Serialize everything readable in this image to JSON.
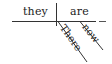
{
  "diagram": {
    "type": "sentence-diagram",
    "style": "Reed-Kellogg",
    "colors": {
      "line": "#333333",
      "text": "#222222",
      "background": "#ffffff"
    },
    "subject": "they",
    "verb": "are",
    "modifiers": [
      {
        "word": "There",
        "attaches_to": "verb"
      },
      {
        "word": "now",
        "attaches_to": "verb"
      }
    ],
    "empty_complement_slot": true
  }
}
